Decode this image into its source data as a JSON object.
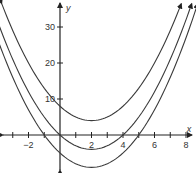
{
  "chart_data": {
    "type": "line",
    "title": "",
    "xlabel": "x",
    "ylabel": "y",
    "xlim": [
      -3.8,
      8.4
    ],
    "ylim": [
      -10.5,
      37
    ],
    "x_ticks": [
      -2,
      2,
      4,
      6,
      8
    ],
    "x_minor_ticks": [
      -3,
      -2,
      -1,
      1,
      2,
      3,
      4,
      5,
      6,
      7,
      8
    ],
    "y_ticks": [
      10,
      20,
      30
    ],
    "grid": false,
    "legend": null,
    "series": [
      {
        "name": "top parabola",
        "equation": "y = (x-2)^2 + 4",
        "vertex": [
          2,
          4
        ],
        "y_intercept": 8
      },
      {
        "name": "middle parabola",
        "equation": "y = (x-2)^2 - 4",
        "vertex": [
          2,
          -4
        ],
        "x_intercepts": [
          0,
          4
        ]
      },
      {
        "name": "bottom parabola",
        "equation": "y = (x-2)^2 - 9",
        "vertex": [
          2,
          -9
        ],
        "x_intercepts": [
          -1,
          5
        ]
      }
    ]
  },
  "labels": {
    "x_axis": "x",
    "y_axis": "y",
    "x_tick_labels": [
      "−2",
      "2",
      "4",
      "6",
      "8"
    ],
    "y_tick_labels": [
      "10",
      "20",
      "30"
    ]
  },
  "colors": {
    "axis": "#222222",
    "curve": "#3a3a3a"
  }
}
